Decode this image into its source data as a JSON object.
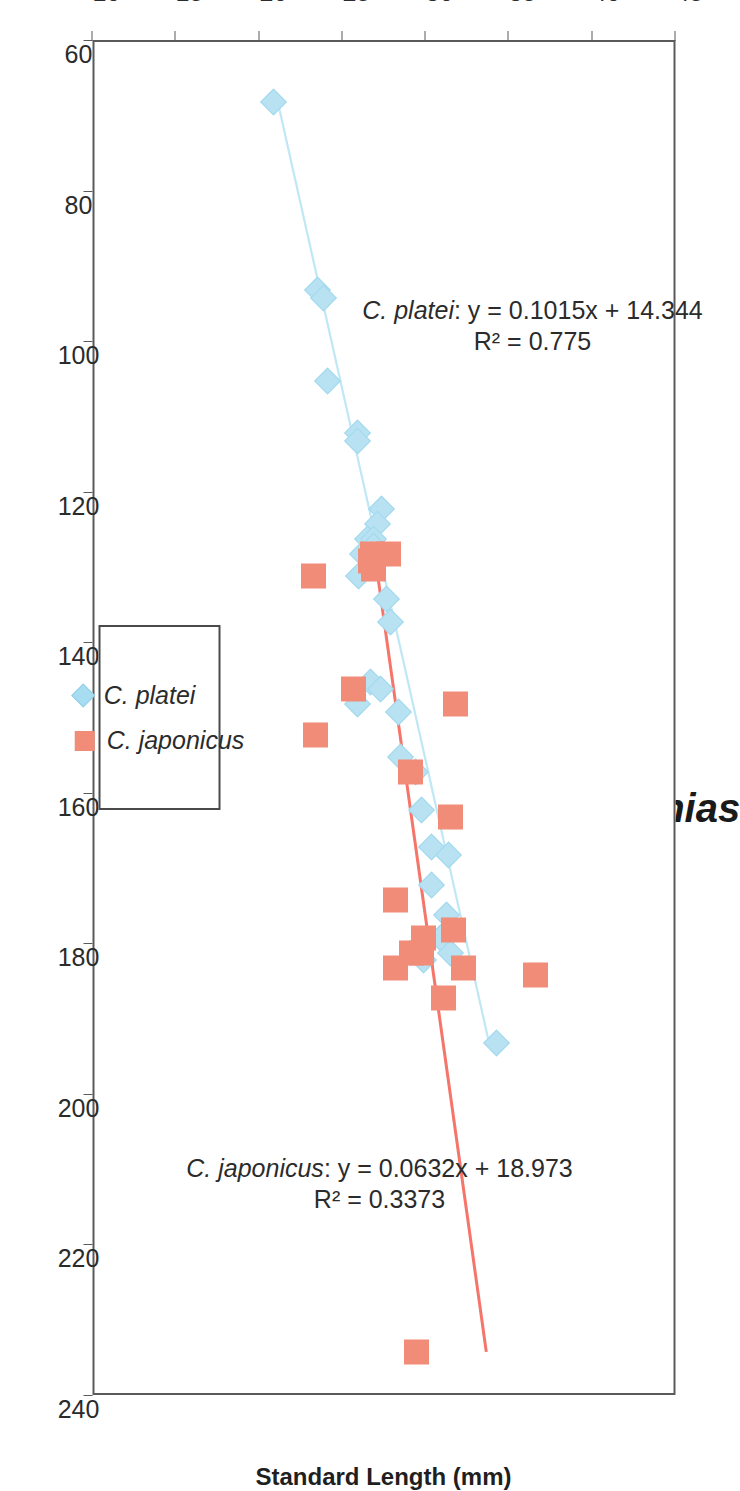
{
  "chart": {
    "title": "Callanthias",
    "x_axis_title": "Standard Length (mm)",
    "y_axis_title": "Number of Pseudobranchial Filaments",
    "legend": {
      "items": [
        {
          "label": "C. platei",
          "marker": "diamond-marker",
          "color": "#a8dcf0"
        },
        {
          "label": "C. japonicus",
          "marker": "square-marker",
          "color": "#f08c78"
        }
      ]
    },
    "annotations": [
      {
        "name": "platei-regression-label",
        "species": "C. platei",
        "equation": "y = 0.1015x + 14.344",
        "r2": "R² = 0.775"
      },
      {
        "name": "japonicus-regression-label",
        "species": "C. japonicus",
        "equation": "y = 0.0632x + 18.973",
        "r2": "R² = 0.3373"
      }
    ]
  },
  "chart_data": {
    "type": "scatter",
    "title": "Callanthias",
    "xlabel": "Standard Length (mm)",
    "ylabel": "Number of Pseudobranchial Filaments",
    "xlim": [
      60,
      240
    ],
    "ylim": [
      10,
      45
    ],
    "xticks": [
      60,
      80,
      100,
      120,
      140,
      160,
      180,
      200,
      220,
      240
    ],
    "yticks": [
      10,
      15,
      20,
      25,
      30,
      35,
      40,
      45
    ],
    "grid": false,
    "legend_position": "right-middle",
    "series": [
      {
        "name": "C. platei",
        "color": "#a8dcf0",
        "marker": "diamond",
        "trendline": {
          "equation": "y = 0.1015x + 14.344",
          "slope": 0.1015,
          "intercept": 14.344,
          "r2": 0.775,
          "x_start": 68,
          "x_end": 193,
          "color": "#bfe7f5"
        },
        "points": [
          [
            68,
            21.0
          ],
          [
            93,
            23.6
          ],
          [
            94,
            24.0
          ],
          [
            105,
            24.2
          ],
          [
            112,
            26.0
          ],
          [
            113,
            26.0
          ],
          [
            122,
            27.5
          ],
          [
            124,
            27.2
          ],
          [
            126,
            26.6
          ],
          [
            126,
            27.0
          ],
          [
            127,
            27.0
          ],
          [
            128,
            26.3
          ],
          [
            131,
            26.1
          ],
          [
            134,
            27.8
          ],
          [
            137,
            28.0
          ],
          [
            145,
            26.8
          ],
          [
            146,
            27.4
          ],
          [
            148,
            26.0
          ],
          [
            149,
            28.5
          ],
          [
            155,
            28.6
          ],
          [
            157,
            29.5
          ],
          [
            162,
            29.9
          ],
          [
            167,
            30.5
          ],
          [
            168,
            31.5
          ],
          [
            172,
            30.5
          ],
          [
            176,
            31.4
          ],
          [
            178,
            31.5
          ],
          [
            179,
            31.0
          ],
          [
            181,
            31.6
          ],
          [
            182,
            30.0
          ],
          [
            193,
            34.4
          ]
        ]
      },
      {
        "name": "C. japonicus",
        "color": "#f08c78",
        "marker": "square",
        "trendline": {
          "equation": "y = 0.0632x + 18.973",
          "slope": 0.0632,
          "intercept": 18.973,
          "r2": 0.3373,
          "x_start": 128,
          "x_end": 234,
          "color": "#f5756a"
        },
        "points": [
          [
            128,
            27.9
          ],
          [
            128,
            26.9
          ],
          [
            129,
            26.8
          ],
          [
            130,
            27.0
          ],
          [
            131,
            23.4
          ],
          [
            146,
            25.8
          ],
          [
            148,
            31.9
          ],
          [
            152,
            23.5
          ],
          [
            157,
            29.2
          ],
          [
            163,
            31.6
          ],
          [
            174,
            28.3
          ],
          [
            178,
            31.8
          ],
          [
            179,
            30.0
          ],
          [
            181,
            29.3
          ],
          [
            181,
            29.9
          ],
          [
            183,
            32.4
          ],
          [
            183,
            28.3
          ],
          [
            184,
            36.7
          ],
          [
            187,
            31.2
          ],
          [
            234,
            29.6
          ]
        ]
      }
    ]
  }
}
